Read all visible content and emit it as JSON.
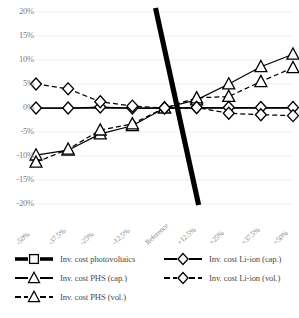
{
  "chart_data": {
    "type": "line",
    "title": "",
    "xlabel": "",
    "ylabel": "",
    "grid": true,
    "legend_position": "bottom",
    "categories": [
      "-50%",
      "-37.5%",
      "-25%",
      "-12.5%",
      "Reference",
      "+12.5%",
      "+25%",
      "+37.5%",
      "+50%"
    ],
    "ylim": [
      -20,
      20
    ],
    "ytick_labels": [
      "20%",
      "15%",
      "10%",
      "5%",
      "0%",
      "-5%",
      "-10%",
      "-15%",
      "-20%"
    ],
    "ytick_values": [
      20,
      15,
      10,
      5,
      0,
      -5,
      -10,
      -15,
      -20
    ],
    "series": [
      {
        "name": "Inv. cost photovoltaics",
        "marker": "square",
        "line": "solid",
        "values": [
          0,
          0,
          0,
          0,
          0,
          0,
          0,
          0,
          0
        ]
      },
      {
        "name": "Inv. cost PHS (cap.)",
        "marker": "triangle",
        "line": "solid",
        "values": [
          -9.8,
          -8.8,
          -5.4,
          -3.7,
          0,
          1.7,
          5.0,
          8.6,
          11.2
        ]
      },
      {
        "name": "Inv. cost PHS (vol.)",
        "marker": "triangle",
        "line": "dashed",
        "values": [
          -11.3,
          -8.6,
          -4.6,
          -3.3,
          0,
          2.1,
          2.4,
          5.5,
          8.4
        ]
      },
      {
        "name": "Inv. cost Li-ion (cap.)",
        "marker": "diamond",
        "line": "solid",
        "values": [
          0,
          0,
          0.2,
          0,
          0,
          0.1,
          0.1,
          0.1,
          0.1
        ]
      },
      {
        "name": "Inv. cost Li-ion (vol.)",
        "marker": "diamond",
        "line": "dashed",
        "values": [
          5.0,
          4.0,
          1.3,
          0.4,
          0,
          0.1,
          -1.1,
          -1.4,
          -1.6
        ]
      }
    ],
    "annotation": {
      "name": "trend-divider-line",
      "description": "thick black diagonal line crossing the reference point",
      "from": {
        "x": "Reference",
        "y": 20
      },
      "to": {
        "x": "+12.5%",
        "y": -20
      }
    },
    "colors": {
      "line": "#000000",
      "grid": "#ededed",
      "tick_text": "#7d7d7d",
      "legend_text": "#4a4a4a",
      "background": "#ffffff"
    }
  },
  "legend": {
    "left_column": [
      {
        "label": "Inv. cost photovoltaics",
        "marker": "square",
        "line": "solid"
      },
      {
        "label": "Inv. cost PHS (cap.)",
        "marker": "triangle",
        "line": "solid"
      },
      {
        "label": "Inv. cost PHS (vol.)",
        "marker": "triangle",
        "line": "dashed"
      }
    ],
    "right_column": [
      {
        "label": "Inv. cost Li-ion (cap.)",
        "marker": "diamond",
        "line": "solid"
      },
      {
        "label": "Inv. cost Li-ion (vol.)",
        "marker": "diamond",
        "line": "dashed"
      }
    ]
  }
}
